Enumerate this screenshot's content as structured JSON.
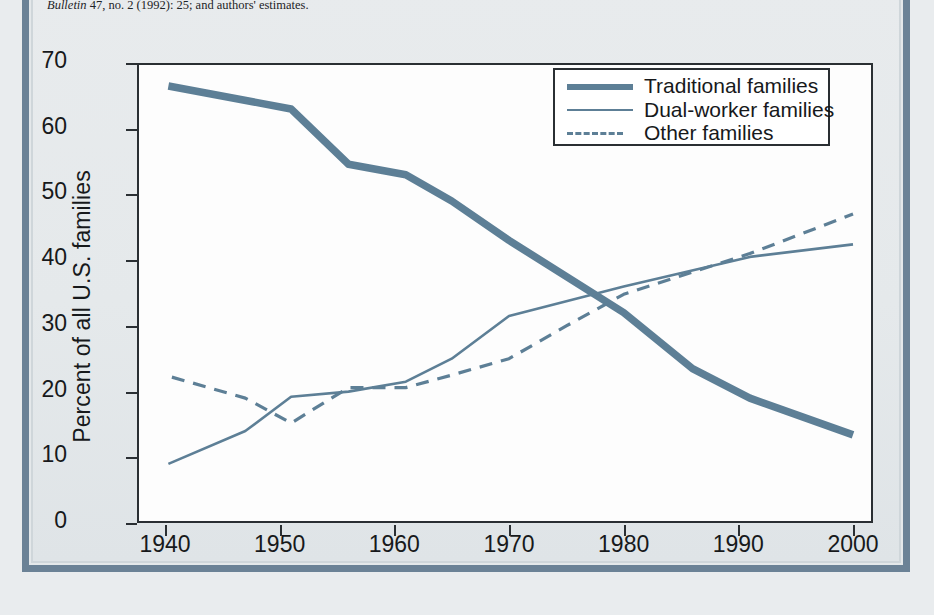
{
  "figure": {
    "source_note_line1": "Bulletin 47, no. 2 (1992): 25; and authors' estimates.",
    "source_note_italic_word": "Bulletin",
    "source_note_rest": " 47, no. 2 (1992): 25; and authors' estimates.",
    "source_note_cut_line": "Sources: ... U.S. Bureau of Labor Statistics, Population"
  },
  "legend": {
    "items": [
      {
        "label": "Traditional families",
        "style": "thick-solid",
        "color": "#5d7f96"
      },
      {
        "label": "Dual-worker families",
        "style": "thin-solid",
        "color": "#5d7f96"
      },
      {
        "label": "Other families",
        "style": "dashed",
        "color": "#5d7f96"
      }
    ]
  },
  "axes": {
    "y_title": "Percent of all U.S. families",
    "y_ticks": [
      "70",
      "60",
      "50",
      "40",
      "30",
      "20",
      "10",
      "0"
    ],
    "x_ticks": [
      "1940",
      "1950",
      "1960",
      "1970",
      "1980",
      "1990",
      "2000"
    ]
  },
  "colors": {
    "line": "#5d7f96",
    "axis": "#2a2f33",
    "page_background": "#e7eaec",
    "frame": "#6b8296",
    "plot_background": "#fdfdfd"
  },
  "chart_data": {
    "type": "line",
    "title": "",
    "subtitle": "",
    "xlabel": "",
    "ylabel": "Percent of all U.S. families",
    "xlim": [
      1940,
      2000
    ],
    "ylim": [
      0,
      70
    ],
    "xticks": [
      1940,
      1950,
      1960,
      1970,
      1980,
      1990,
      2000
    ],
    "yticks": [
      0,
      10,
      20,
      30,
      40,
      50,
      60,
      70
    ],
    "grid": false,
    "legend_position": "top-right",
    "series": [
      {
        "name": "Traditional families",
        "style": "thick-solid",
        "color": "#5d7f96",
        "x": [
          1940.3,
          1951,
          1956,
          1961,
          1965,
          1970,
          1980,
          1986,
          1991,
          2000
        ],
        "values": [
          66.5,
          63.0,
          54.6,
          53.0,
          49.0,
          43.0,
          32.0,
          23.5,
          19.0,
          13.4
        ]
      },
      {
        "name": "Dual-worker families",
        "style": "thin-solid",
        "color": "#5d7f96",
        "x": [
          1940.3,
          1947,
          1951,
          1956,
          1961,
          1965,
          1970,
          1980,
          1991,
          2000
        ],
        "values": [
          9.0,
          14.0,
          19.2,
          20.0,
          21.5,
          25.0,
          31.5,
          36.0,
          40.5,
          42.4
        ]
      },
      {
        "name": "Other families",
        "style": "dashed",
        "color": "#5d7f96",
        "x": [
          1940.6,
          1947,
          1951,
          1956,
          1961,
          1965,
          1970,
          1975,
          1980,
          1991,
          2000
        ],
        "values": [
          22.2,
          19.0,
          15.2,
          20.6,
          20.6,
          22.5,
          25.0,
          30.0,
          34.8,
          41.0,
          47.0
        ]
      }
    ]
  }
}
